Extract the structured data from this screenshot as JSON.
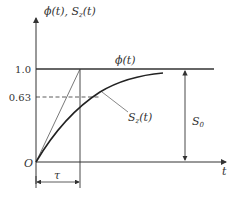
{
  "diagram": {
    "y_axis_label": "ϕ(t), S",
    "y_axis_label_sub": "z",
    "y_axis_label_tail": "(t)",
    "x_axis_label": "t",
    "origin_label": "O",
    "tick_1": "1.0",
    "tick_063": "0.63",
    "phi_label": "ϕ(t)",
    "sz_label": "S",
    "sz_label_sub": "z",
    "sz_label_tail": "(t)",
    "s0_label": "S",
    "s0_label_sub": "0",
    "tau_label": "τ",
    "colors": {
      "line": "#333333",
      "background": "#ffffff"
    }
  }
}
